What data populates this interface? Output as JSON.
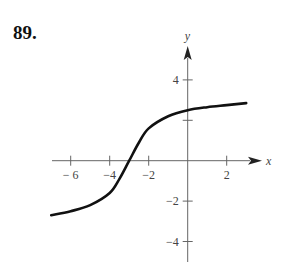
{
  "problem_number": "89.",
  "chart_data": {
    "type": "line",
    "title": "",
    "xlabel": "x",
    "ylabel": "y",
    "xlim": [
      -7,
      3
    ],
    "ylim": [
      -4.5,
      4.5
    ],
    "grid": false,
    "x_ticks": [
      -6,
      -4,
      -2,
      2
    ],
    "x_tick_labels": [
      "− 6",
      "−4",
      "−2",
      "2"
    ],
    "y_ticks": [
      4,
      2,
      -2,
      -4
    ],
    "y_tick_labels": [
      "4",
      "",
      "−2",
      "−4"
    ],
    "series": [
      {
        "name": "curve",
        "x": [
          -7,
          -6,
          -5,
          -4,
          -3.5,
          -3,
          -2.5,
          -2,
          -1,
          0,
          1,
          2,
          3
        ],
        "y": [
          -2.7,
          -2.5,
          -2.2,
          -1.6,
          -0.9,
          0,
          0.9,
          1.6,
          2.2,
          2.5,
          2.65,
          2.75,
          2.85
        ]
      }
    ]
  }
}
